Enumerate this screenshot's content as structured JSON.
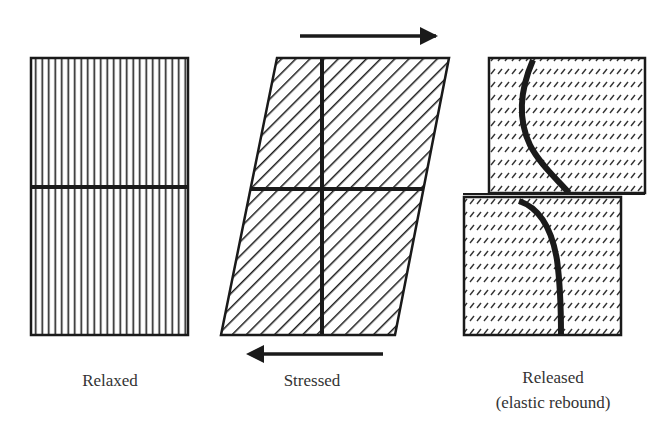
{
  "figure": {
    "type": "elastic-rebound-diagram",
    "panels": [
      {
        "id": "relaxed",
        "label": "Relaxed",
        "hatch": "vertical-lines",
        "shape": "rectangle"
      },
      {
        "id": "stressed",
        "label": "Stressed",
        "hatch": "diagonal-lines",
        "shape": "parallelogram",
        "arrows": [
          "right (top)",
          "left (bottom)"
        ]
      },
      {
        "id": "released",
        "label_line1": "Released",
        "label_line2": "(elastic rebound)",
        "hatch": "diagonal-dashes",
        "shape": "two offset blocks with curved marker lines"
      }
    ]
  },
  "labels": {
    "relaxed": "Relaxed",
    "stressed": "Stressed",
    "released_line1": "Released",
    "released_line2": "(elastic rebound)"
  },
  "colors": {
    "ink": "#1a1a1a",
    "text": "#333333",
    "background": "#ffffff"
  }
}
